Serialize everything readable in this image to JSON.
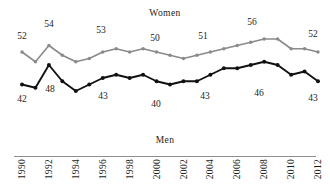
{
  "chart_data": {
    "type": "line",
    "title": "",
    "xlabel": "",
    "ylabel": "",
    "grid": false,
    "legend_position": "inline-series-titles",
    "ylim": [
      36,
      60
    ],
    "xlim": [
      1990,
      2012
    ],
    "x": [
      1990,
      1991,
      1992,
      1993,
      1994,
      1995,
      1996,
      1997,
      1998,
      1999,
      2000,
      2001,
      2002,
      2003,
      2004,
      2005,
      2006,
      2007,
      2008,
      2009,
      2010,
      2011,
      2012
    ],
    "xtick_labels": [
      "1990",
      "1992",
      "1994",
      "1996",
      "1998",
      "2000",
      "2002",
      "2004",
      "2006",
      "2008",
      "2010",
      "2012"
    ],
    "series": [
      {
        "name": "Women",
        "color": "#8a8a8a",
        "values": [
          52,
          49,
          54,
          51,
          49,
          50,
          52,
          53,
          52,
          53,
          52,
          51,
          50,
          51,
          52,
          53,
          54,
          55,
          56,
          56,
          53,
          53,
          52
        ]
      },
      {
        "name": "Men",
        "color": "#111111",
        "values": [
          42,
          41,
          48,
          43,
          40,
          42,
          44,
          45,
          44,
          45,
          43,
          42,
          43,
          43,
          45,
          47,
          47,
          48,
          49,
          48,
          45,
          46,
          43
        ]
      }
    ],
    "point_labels": [
      {
        "series": "Women",
        "year": 1990,
        "value": "52"
      },
      {
        "series": "Women",
        "year": 1992,
        "value": "54"
      },
      {
        "series": "Women",
        "year": 1996,
        "value": "53"
      },
      {
        "series": "Women",
        "year": 2000,
        "value": "50"
      },
      {
        "series": "Women",
        "year": 2003,
        "value": "51"
      },
      {
        "series": "Women",
        "year": 2008,
        "value": "56"
      },
      {
        "series": "Women",
        "year": 2012,
        "value": "52"
      },
      {
        "series": "Men",
        "year": 1990,
        "value": "42"
      },
      {
        "series": "Men",
        "year": 1992,
        "value": "48"
      },
      {
        "series": "Men",
        "year": 1995,
        "value": "43"
      },
      {
        "series": "Men",
        "year": 2000,
        "value": "40"
      },
      {
        "series": "Men",
        "year": 2003,
        "value": "43"
      },
      {
        "series": "Men",
        "year": 2008,
        "value": "46"
      },
      {
        "series": "Men",
        "year": 2012,
        "value": "43"
      }
    ]
  },
  "labels": {
    "women_title": "Women",
    "men_title": "Men",
    "w_1990": "52",
    "w_1992": "54",
    "w_1996": "53",
    "w_2000": "50",
    "w_2003": "51",
    "w_2008": "56",
    "w_2012": "52",
    "m_1990": "42",
    "m_1992": "48",
    "m_1995": "43",
    "m_2000": "40",
    "m_2003": "43",
    "m_2008": "46",
    "m_2012": "43"
  },
  "axis": {
    "ticks": [
      "1990",
      "1992",
      "1994",
      "1996",
      "1998",
      "2000",
      "2002",
      "2004",
      "2006",
      "2008",
      "2010",
      "2012"
    ]
  },
  "colors": {
    "women_line": "#8a8a8a",
    "men_line": "#111111",
    "axis_rule": "#8f8f8f",
    "text": "#1c1c1c",
    "background": "#ffffff"
  }
}
